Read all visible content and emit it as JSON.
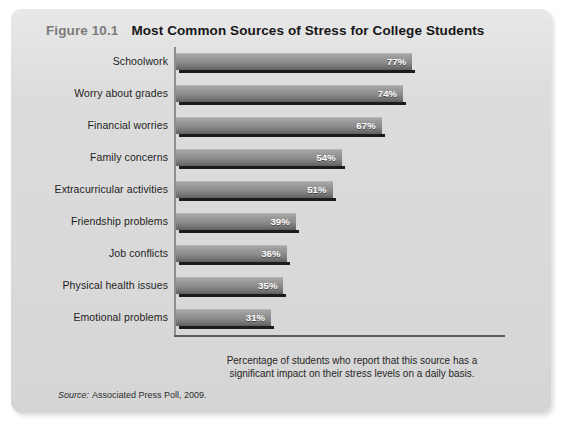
{
  "figure": {
    "number": "Figure 10.1",
    "title": "Most Common Sources of Stress for College Students",
    "caption": "Percentage of students who report that this source has a significant impact on their stress levels on a daily basis.",
    "source_label": "Source:",
    "source_text": "Associated Press Poll, 2009."
  },
  "colors": {
    "panel_background": "#dcdcdc",
    "bar_light": "#a9a9a9",
    "bar_dark": "#5e5e5e",
    "bar_shadow": "#1c1c1c",
    "value_label": "#ffffff",
    "figure_number": "#7b7b7b",
    "title_text": "#161616",
    "axis": "#8e8e8e"
  },
  "chart_data": {
    "type": "bar",
    "orientation": "horizontal",
    "title": "Most Common Sources of Stress for College Students",
    "xlabel": "Percentage of students who report that this source has a significant impact on their stress levels on a daily basis.",
    "ylabel": "",
    "xlim": [
      0,
      100
    ],
    "grid": false,
    "legend": "none",
    "axis_tick_labels": [],
    "categories": [
      "Schoolwork",
      "Worry about grades",
      "Financial worries",
      "Family concerns",
      "Extracurricular activities",
      "Friendship problems",
      "Job conflicts",
      "Physical health issues",
      "Emotional problems"
    ],
    "values": [
      77,
      74,
      67,
      54,
      51,
      39,
      36,
      35,
      31
    ],
    "data_labels": [
      "77%",
      "74%",
      "67%",
      "54%",
      "51%",
      "39%",
      "36%",
      "35%",
      "31%"
    ],
    "source": "Associated Press Poll, 2009."
  }
}
